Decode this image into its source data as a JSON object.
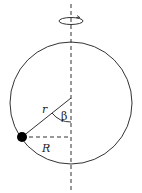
{
  "diagram": {
    "labels": {
      "radius_hoop": "r",
      "angle": "β",
      "radius_rotation": "R"
    },
    "colors": {
      "stroke": "#333333",
      "bead": "#000000",
      "background": "#ffffff"
    }
  }
}
